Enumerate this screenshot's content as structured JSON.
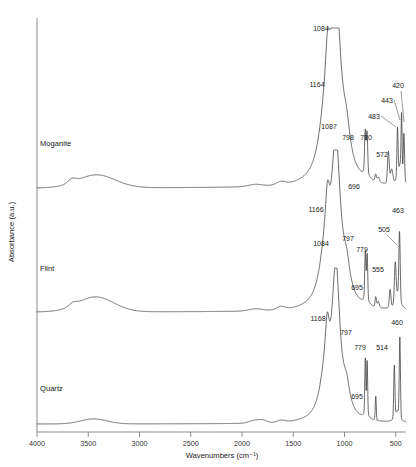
{
  "figure": {
    "title": "",
    "background": "#ffffff",
    "trace_color": "#3a3a3a",
    "axis_color": "#808080"
  },
  "axes": {
    "x_label": "Wavenumbers (cm⁻¹)",
    "y_label": "Absorbance (a.u.)",
    "x_ticks": [
      "4000",
      "3500",
      "3000",
      "2500",
      "2000",
      "1500",
      "1000",
      "500"
    ],
    "x_tick_values": [
      4000,
      3500,
      3000,
      2500,
      2000,
      1500,
      1000,
      500
    ],
    "x_min": 4000,
    "x_max": 400,
    "y_ticks": [],
    "grid": "off"
  },
  "sample_labels": {
    "moganite": "Moganite",
    "flint": "Flint",
    "quartz": "Quartz"
  },
  "peak_labels": {
    "moganite": [
      "1084",
      "1164",
      "1087",
      "798",
      "780",
      "696",
      "572",
      "483",
      "443",
      "420"
    ],
    "flint": [
      "1166",
      "1084",
      "797",
      "779",
      "695",
      "555",
      "505",
      "463"
    ],
    "quartz": [
      "1168",
      "797",
      "779",
      "695",
      "514",
      "460"
    ]
  },
  "chart_data": {
    "type": "line",
    "title": "",
    "subtitle": "",
    "xlabel": "Wavenumbers (cm⁻¹)",
    "ylabel": "Absorbance (a.u.)",
    "xlim": [
      4000,
      400
    ],
    "x_axis_direction": "reversed",
    "ylim": [
      0,
      1
    ],
    "grid": false,
    "legend": "inline-left-of-each-trace",
    "legend_position": "inline",
    "series": [
      {
        "name": "Moganite",
        "offset_label": "Moganite",
        "peaks": [
          {
            "wavenumber": 1084,
            "label": "1084",
            "role": "main Si-O-Si asymmetric stretch"
          },
          {
            "wavenumber": 1164,
            "label": "1164",
            "role": "shoulder"
          },
          {
            "wavenumber": 1087,
            "label": "1087",
            "role": "secondary band"
          },
          {
            "wavenumber": 798,
            "label": "798",
            "role": "doublet"
          },
          {
            "wavenumber": 780,
            "label": "780",
            "role": "doublet"
          },
          {
            "wavenumber": 696,
            "label": "696",
            "role": "weak band"
          },
          {
            "wavenumber": 572,
            "label": "572",
            "role": "moganite marker"
          },
          {
            "wavenumber": 483,
            "label": "483",
            "role": "Si-O bend"
          },
          {
            "wavenumber": 443,
            "label": "443",
            "role": "Si-O bend"
          },
          {
            "wavenumber": 420,
            "label": "420",
            "role": "Si-O bend"
          }
        ],
        "broad_bands": [
          {
            "wavenumber": 3420,
            "label": "",
            "role": "O-H stretch (broad)"
          }
        ]
      },
      {
        "name": "Flint",
        "offset_label": "Flint",
        "peaks": [
          {
            "wavenumber": 1166,
            "label": "1166",
            "role": "shoulder"
          },
          {
            "wavenumber": 1084,
            "label": "1084",
            "role": "main Si-O-Si asymmetric stretch"
          },
          {
            "wavenumber": 797,
            "label": "797",
            "role": "doublet"
          },
          {
            "wavenumber": 779,
            "label": "779",
            "role": "doublet"
          },
          {
            "wavenumber": 695,
            "label": "695",
            "role": "weak band"
          },
          {
            "wavenumber": 555,
            "label": "555",
            "role": "weak band"
          },
          {
            "wavenumber": 505,
            "label": "505",
            "role": "Si-O bend"
          },
          {
            "wavenumber": 463,
            "label": "463",
            "role": "Si-O bend"
          }
        ],
        "broad_bands": [
          {
            "wavenumber": 3430,
            "label": "",
            "role": "O-H stretch (broad)"
          }
        ]
      },
      {
        "name": "Quartz",
        "offset_label": "Quartz",
        "peaks": [
          {
            "wavenumber": 1168,
            "label": "1168",
            "role": "shoulder"
          },
          {
            "wavenumber": 797,
            "label": "797",
            "role": "doublet"
          },
          {
            "wavenumber": 779,
            "label": "779",
            "role": "doublet"
          },
          {
            "wavenumber": 695,
            "label": "695",
            "role": "weak band"
          },
          {
            "wavenumber": 514,
            "label": "514",
            "role": "Si-O bend"
          },
          {
            "wavenumber": 460,
            "label": "460",
            "role": "Si-O bend"
          }
        ],
        "broad_bands": [
          {
            "wavenumber": 3440,
            "label": "",
            "role": "O-H stretch (weak broad)"
          }
        ]
      }
    ]
  }
}
